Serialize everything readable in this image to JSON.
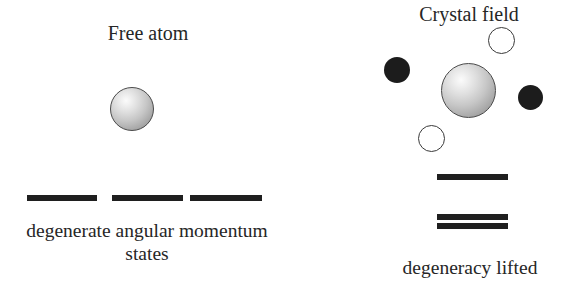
{
  "figure": {
    "background_color": "#ffffff",
    "width": 578,
    "height": 293
  },
  "left_panel": {
    "title": "Free atom",
    "caption": "degenerate angular momentum states",
    "sphere": {
      "name": "free-atom",
      "fill_highlight": "#fbfbfb",
      "fill_shadow": "#8a8a8a",
      "outline_color": "#4a4a4a"
    },
    "energy_levels": {
      "count": 3,
      "arrangement": "three equal-energy levels side by side",
      "color": "#1f1f1f"
    }
  },
  "right_panel": {
    "title": "Crystal field",
    "caption": "degeneracy lifted",
    "sphere": {
      "name": "central-ion",
      "fill_highlight": "#fbfbfb",
      "fill_shadow": "#8a8a8a",
      "outline_color": "#4a4a4a"
    },
    "ligands": [
      {
        "name": "ligand-top-open",
        "style": "open",
        "fill": "#ffffff",
        "outline": "#3a3a3a"
      },
      {
        "name": "ligand-left-filled",
        "style": "filled",
        "fill": "#1c1c1c",
        "outline": "#1c1c1c"
      },
      {
        "name": "ligand-right-filled",
        "style": "filled",
        "fill": "#1c1c1c",
        "outline": "#1c1c1c"
      },
      {
        "name": "ligand-bottom-open",
        "style": "open",
        "fill": "#ffffff",
        "outline": "#3a3a3a"
      }
    ],
    "energy_levels": {
      "count": 3,
      "arrangement": "one upper level and two lower levels",
      "color": "#1f1f1f"
    }
  }
}
